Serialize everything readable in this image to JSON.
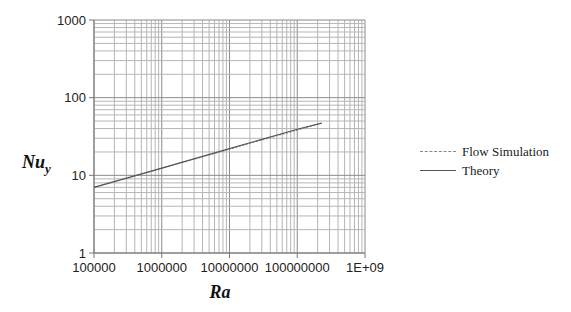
{
  "chart_data": {
    "type": "line",
    "title": "",
    "xlabel": "Ra",
    "ylabel": "Nu_y",
    "xscale": "log",
    "yscale": "log",
    "xlim": [
      100000,
      1000000000
    ],
    "ylim": [
      1,
      1000
    ],
    "x_tick_labels": [
      "100000",
      "1000000",
      "10000000",
      "100000000",
      "1E+09"
    ],
    "y_tick_labels": [
      "1",
      "10",
      "100",
      "1000"
    ],
    "grid": true,
    "grid_minor": true,
    "legend_position": "right",
    "legend": [
      "Flow Simulation",
      "Theory"
    ],
    "series": [
      {
        "name": "Flow Simulation",
        "style": "dashed",
        "color": "#888888",
        "x": [
          100000,
          230000000
        ],
        "y": [
          7.0,
          47.0
        ]
      },
      {
        "name": "Theory",
        "style": "solid",
        "color": "#555555",
        "x": [
          100000,
          1000000,
          10000000,
          100000000,
          230000000
        ],
        "y": [
          7.0,
          12.4,
          22.1,
          39.3,
          47.0
        ]
      }
    ]
  },
  "labels": {
    "ylabel_main": "Nu",
    "ylabel_sub": "y",
    "xlabel": "Ra",
    "legend_flow": "Flow Simulation",
    "legend_theory": "Theory"
  }
}
